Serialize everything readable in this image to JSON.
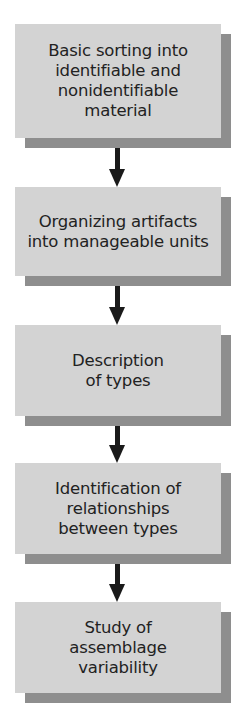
{
  "diagram": {
    "type": "flowchart",
    "direction": "top-to-bottom",
    "colors": {
      "box_fill": "#d3d3d3",
      "box_shadow": "#8e8e8e",
      "text": "#222222",
      "arrow": "#1a1a1a",
      "background": "#ffffff"
    },
    "steps": [
      {
        "label": "Basic sorting into identifiable and nonidentifiable material"
      },
      {
        "label": "Organizing artifacts into manageable units"
      },
      {
        "label": "Description of types"
      },
      {
        "label": "Identification of relationships between types"
      },
      {
        "label": "Study of assemblage variability"
      }
    ],
    "connections": [
      {
        "from": 0,
        "to": 1
      },
      {
        "from": 1,
        "to": 2
      },
      {
        "from": 2,
        "to": 3
      },
      {
        "from": 3,
        "to": 4
      }
    ]
  }
}
